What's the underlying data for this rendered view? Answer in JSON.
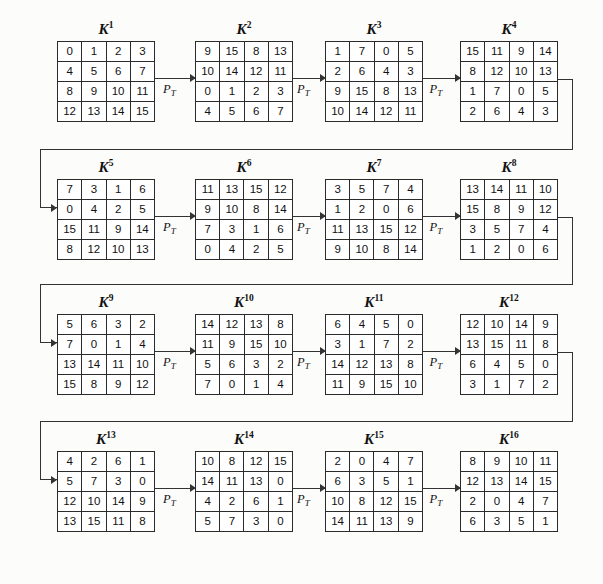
{
  "figure": {
    "type": "key-schedule-diagram",
    "transform_label": "P",
    "transform_sub": "T",
    "key_prefix": "K",
    "matrix_rows": 4,
    "matrix_cols": 4,
    "ink_color": "#2b2b2b",
    "page_color": "#fcfcfa"
  },
  "matrices": [
    {
      "name": "K",
      "exp": "1",
      "cells": [
        [
          0,
          1,
          2,
          3
        ],
        [
          4,
          5,
          6,
          7
        ],
        [
          8,
          9,
          10,
          11
        ],
        [
          12,
          13,
          14,
          15
        ]
      ]
    },
    {
      "name": "K",
      "exp": "2",
      "cells": [
        [
          9,
          15,
          8,
          13
        ],
        [
          10,
          14,
          12,
          11
        ],
        [
          0,
          1,
          2,
          3
        ],
        [
          4,
          5,
          6,
          7
        ]
      ]
    },
    {
      "name": "K",
      "exp": "3",
      "cells": [
        [
          1,
          7,
          0,
          5
        ],
        [
          2,
          6,
          4,
          3
        ],
        [
          9,
          15,
          8,
          13
        ],
        [
          10,
          14,
          12,
          11
        ]
      ]
    },
    {
      "name": "K",
      "exp": "4",
      "cells": [
        [
          15,
          11,
          9,
          14
        ],
        [
          8,
          12,
          10,
          13
        ],
        [
          1,
          7,
          0,
          5
        ],
        [
          2,
          6,
          4,
          3
        ]
      ]
    },
    {
      "name": "K",
      "exp": "5",
      "cells": [
        [
          7,
          3,
          1,
          6
        ],
        [
          0,
          4,
          2,
          5
        ],
        [
          15,
          11,
          9,
          14
        ],
        [
          8,
          12,
          10,
          13
        ]
      ]
    },
    {
      "name": "K",
      "exp": "6",
      "cells": [
        [
          11,
          13,
          15,
          12
        ],
        [
          9,
          10,
          8,
          14
        ],
        [
          7,
          3,
          1,
          6
        ],
        [
          0,
          4,
          2,
          5
        ]
      ]
    },
    {
      "name": "K",
      "exp": "7",
      "cells": [
        [
          3,
          5,
          7,
          4
        ],
        [
          1,
          2,
          0,
          6
        ],
        [
          11,
          13,
          15,
          12
        ],
        [
          9,
          10,
          8,
          14
        ]
      ]
    },
    {
      "name": "K",
      "exp": "8",
      "cells": [
        [
          13,
          14,
          11,
          10
        ],
        [
          15,
          8,
          9,
          12
        ],
        [
          3,
          5,
          7,
          4
        ],
        [
          1,
          2,
          0,
          6
        ]
      ]
    },
    {
      "name": "K",
      "exp": "9",
      "cells": [
        [
          5,
          6,
          3,
          2
        ],
        [
          7,
          0,
          1,
          4
        ],
        [
          13,
          14,
          11,
          10
        ],
        [
          15,
          8,
          9,
          12
        ]
      ]
    },
    {
      "name": "K",
      "exp": "10",
      "cells": [
        [
          14,
          12,
          13,
          8
        ],
        [
          11,
          9,
          15,
          10
        ],
        [
          5,
          6,
          3,
          2
        ],
        [
          7,
          0,
          1,
          4
        ]
      ]
    },
    {
      "name": "K",
      "exp": "11",
      "cells": [
        [
          6,
          4,
          5,
          0
        ],
        [
          3,
          1,
          7,
          2
        ],
        [
          14,
          12,
          13,
          8
        ],
        [
          11,
          9,
          15,
          10
        ]
      ]
    },
    {
      "name": "K",
      "exp": "12",
      "cells": [
        [
          12,
          10,
          14,
          9
        ],
        [
          13,
          15,
          11,
          8
        ],
        [
          6,
          4,
          5,
          0
        ],
        [
          3,
          1,
          7,
          2
        ]
      ]
    },
    {
      "name": "K",
      "exp": "13",
      "cells": [
        [
          4,
          2,
          6,
          1
        ],
        [
          5,
          7,
          3,
          0
        ],
        [
          12,
          10,
          14,
          9
        ],
        [
          13,
          15,
          11,
          8
        ]
      ]
    },
    {
      "name": "K",
      "exp": "14",
      "cells": [
        [
          10,
          8,
          12,
          15
        ],
        [
          14,
          11,
          13,
          0
        ],
        [
          4,
          2,
          6,
          1
        ],
        [
          5,
          7,
          3,
          0
        ]
      ]
    },
    {
      "name": "K",
      "exp": "15",
      "cells": [
        [
          2,
          0,
          4,
          7
        ],
        [
          6,
          3,
          5,
          1
        ],
        [
          10,
          8,
          12,
          15
        ],
        [
          14,
          11,
          13,
          9
        ]
      ]
    },
    {
      "name": "K",
      "exp": "16",
      "cells": [
        [
          8,
          9,
          10,
          11
        ],
        [
          12,
          13,
          14,
          15
        ],
        [
          2,
          0,
          4,
          7
        ],
        [
          6,
          3,
          5,
          1
        ]
      ]
    }
  ],
  "arrow_labels": [
    "P",
    "P",
    "P",
    "P",
    "P",
    "P",
    "P",
    "P",
    "P",
    "P",
    "P",
    "P"
  ],
  "arrow_sublabel": "T"
}
